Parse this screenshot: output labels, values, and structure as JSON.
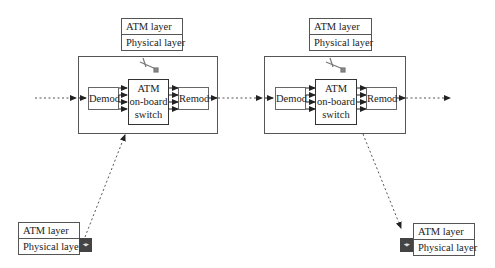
{
  "colors": {
    "line": "#555555",
    "arrow": "#222222",
    "background": "#ffffff"
  },
  "satellites": [
    {
      "id": "satellite-1",
      "stack": [
        "ATM layer",
        "Physical layer"
      ],
      "demod": "Demod",
      "switch": [
        "ATM",
        "on-board",
        "switch"
      ],
      "remod": "Remod",
      "icon": "satellite-icon"
    },
    {
      "id": "satellite-2",
      "stack": [
        "ATM layer",
        "Physical layer"
      ],
      "demod": "Demod",
      "switch": [
        "ATM",
        "on-board",
        "switch"
      ],
      "remod": "Remod",
      "icon": "satellite-icon"
    }
  ],
  "ground_stations": [
    {
      "id": "source-earth-station",
      "stack": [
        "ATM layer",
        "Physical layer"
      ],
      "icon": "earth-station-icon",
      "direction": "uplink"
    },
    {
      "id": "destination-earth-station",
      "stack": [
        "ATM layer",
        "Physical layer"
      ],
      "icon": "earth-station-icon",
      "direction": "downlink"
    }
  ],
  "links": [
    {
      "from": "left-edge",
      "to": "satellite-1-demod",
      "style": "dashed"
    },
    {
      "from": "satellite-1-remod",
      "to": "satellite-2-demod",
      "style": "dashed"
    },
    {
      "from": "satellite-2-remod",
      "to": "right-edge",
      "style": "dashed"
    },
    {
      "from": "source-earth-station",
      "to": "satellite-1",
      "style": "dashed"
    },
    {
      "from": "satellite-2",
      "to": "destination-earth-station",
      "style": "dashed"
    }
  ]
}
